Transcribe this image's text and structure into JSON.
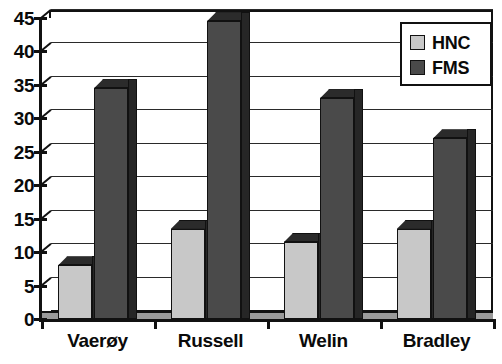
{
  "chart_data": {
    "type": "bar",
    "title": "",
    "subtitle": "",
    "xlabel": "",
    "ylabel": "",
    "categories": [
      "Vaerøy",
      "Russell",
      "Welin",
      "Bradley"
    ],
    "series": [
      {
        "name": "HNC",
        "values": [
          8,
          13.5,
          11.5,
          13.5
        ],
        "color": "#c8c8c8"
      },
      {
        "name": "FMS",
        "values": [
          34.5,
          44.5,
          33,
          27
        ],
        "color": "#4a4a4a"
      }
    ],
    "ylim": [
      0,
      45
    ],
    "ytick_step": 5,
    "ytick_labels": [
      "45",
      "40",
      "35",
      "30",
      "25",
      "20",
      "15",
      "10",
      "5",
      "0"
    ],
    "grid": true,
    "grid_axis": "y",
    "legend_position": "top-right",
    "style_3d": true,
    "plot_background": "#ffffff",
    "axis_color": "#111111",
    "gridline_color": "#2a2a2a"
  },
  "legend": {
    "entries": [
      {
        "label": "HNC",
        "swatch_color": "#c8c8c8",
        "swatch_icon": "legend-swatch-icon"
      },
      {
        "label": "FMS",
        "swatch_color": "#4a4a4a",
        "swatch_icon": "legend-swatch-icon"
      }
    ]
  }
}
